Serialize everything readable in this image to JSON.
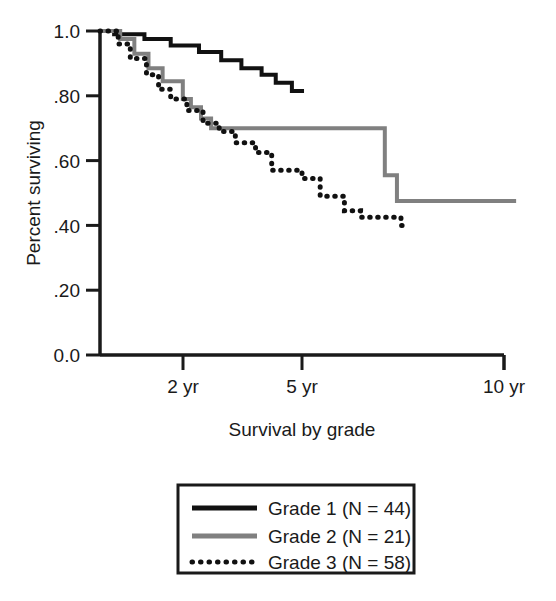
{
  "chart_data": {
    "type": "line",
    "subtype": "kaplan-meier-step",
    "title": "",
    "xlabel": "Survival by grade",
    "ylabel": "Percent surviving",
    "xlim": [
      0,
      10.6
    ],
    "ylim": [
      0.0,
      1.0
    ],
    "grid": false,
    "legend_position": "below-plot",
    "x_ticks": [
      {
        "value": 2,
        "label": "2 yr"
      },
      {
        "value": 5,
        "label": "5 yr"
      },
      {
        "value": 10,
        "label": "10 yr"
      }
    ],
    "y_ticks": [
      {
        "value": 1.0,
        "label": "1.0"
      },
      {
        "value": 0.8,
        "label": ".80"
      },
      {
        "value": 0.6,
        "label": ".60"
      },
      {
        "value": 0.4,
        "label": ".40"
      },
      {
        "value": 0.2,
        "label": ".20"
      },
      {
        "value": 0.0,
        "label": "0.0"
      }
    ],
    "series": [
      {
        "name": "Grade 1 (N = 44)",
        "group": "Grade 1",
        "n": 44,
        "color": "#111111",
        "style": "solid",
        "width": 4,
        "points": [
          [
            0.0,
            1.0
          ],
          [
            0.35,
            1.0
          ],
          [
            0.35,
            0.99
          ],
          [
            1.1,
            0.99
          ],
          [
            1.1,
            0.975
          ],
          [
            1.75,
            0.975
          ],
          [
            1.75,
            0.955
          ],
          [
            2.45,
            0.955
          ],
          [
            2.45,
            0.935
          ],
          [
            3.0,
            0.935
          ],
          [
            3.0,
            0.91
          ],
          [
            3.5,
            0.91
          ],
          [
            3.5,
            0.885
          ],
          [
            4.0,
            0.885
          ],
          [
            4.0,
            0.865
          ],
          [
            4.35,
            0.865
          ],
          [
            4.35,
            0.84
          ],
          [
            4.75,
            0.84
          ],
          [
            4.75,
            0.815
          ],
          [
            5.05,
            0.815
          ]
        ]
      },
      {
        "name": "Grade 2 (N = 21)",
        "group": "Grade 2",
        "n": 21,
        "color": "#808080",
        "style": "solid",
        "width": 4,
        "points": [
          [
            0.0,
            1.0
          ],
          [
            0.5,
            1.0
          ],
          [
            0.5,
            0.975
          ],
          [
            0.85,
            0.975
          ],
          [
            0.85,
            0.93
          ],
          [
            1.2,
            0.93
          ],
          [
            1.2,
            0.885
          ],
          [
            1.55,
            0.885
          ],
          [
            1.55,
            0.845
          ],
          [
            2.05,
            0.845
          ],
          [
            2.05,
            0.79
          ],
          [
            2.25,
            0.79
          ],
          [
            2.25,
            0.765
          ],
          [
            2.5,
            0.765
          ],
          [
            2.5,
            0.73
          ],
          [
            2.75,
            0.73
          ],
          [
            2.75,
            0.7
          ],
          [
            7.05,
            0.7
          ],
          [
            7.05,
            0.555
          ],
          [
            7.35,
            0.555
          ],
          [
            7.35,
            0.475
          ],
          [
            10.3,
            0.475
          ]
        ]
      },
      {
        "name": "Grade 3 (N = 58)",
        "group": "Grade 3",
        "n": 58,
        "color": "#111111",
        "style": "dotted",
        "width": 5,
        "points": [
          [
            0.0,
            1.0
          ],
          [
            0.45,
            1.0
          ],
          [
            0.45,
            0.96
          ],
          [
            0.75,
            0.96
          ],
          [
            0.75,
            0.915
          ],
          [
            1.15,
            0.915
          ],
          [
            1.15,
            0.865
          ],
          [
            1.45,
            0.865
          ],
          [
            1.45,
            0.82
          ],
          [
            1.75,
            0.82
          ],
          [
            1.75,
            0.79
          ],
          [
            2.15,
            0.79
          ],
          [
            2.15,
            0.755
          ],
          [
            2.55,
            0.755
          ],
          [
            2.55,
            0.715
          ],
          [
            2.95,
            0.715
          ],
          [
            2.95,
            0.69
          ],
          [
            3.35,
            0.69
          ],
          [
            3.35,
            0.655
          ],
          [
            3.85,
            0.655
          ],
          [
            3.85,
            0.625
          ],
          [
            4.25,
            0.625
          ],
          [
            4.25,
            0.57
          ],
          [
            5.0,
            0.57
          ],
          [
            5.0,
            0.545
          ],
          [
            5.45,
            0.545
          ],
          [
            5.45,
            0.49
          ],
          [
            6.05,
            0.49
          ],
          [
            6.05,
            0.445
          ],
          [
            6.45,
            0.445
          ],
          [
            6.45,
            0.425
          ],
          [
            7.45,
            0.425
          ],
          [
            7.45,
            0.4
          ],
          [
            7.6,
            0.4
          ]
        ]
      }
    ]
  },
  "axes": {
    "y_label": "Percent surviving",
    "x_label": "Survival by grade"
  },
  "legend": {
    "entries": [
      {
        "label": "Grade 1 (N = 44)",
        "swatch": "solid-black-line-swatch"
      },
      {
        "label": "Grade 2 (N = 21)",
        "swatch": "solid-gray-line-swatch"
      },
      {
        "label": "Grade 3 (N = 58)",
        "swatch": "dotted-black-line-swatch"
      }
    ]
  },
  "colors": {
    "grade1": "#111111",
    "grade2": "#808080",
    "grade3": "#111111",
    "axis": "#1a1a1a",
    "background": "#ffffff"
  }
}
